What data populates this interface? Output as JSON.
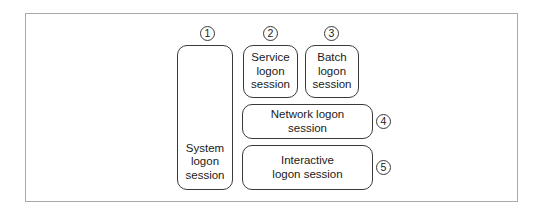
{
  "diagram": {
    "frame_color": "#a9a9a9",
    "stroke_color": "#3a3a3a",
    "sessions": [
      {
        "id": 1,
        "number": "1",
        "label": "System\nlogon\nsession"
      },
      {
        "id": 2,
        "number": "2",
        "label": "Service\nlogon\nsession"
      },
      {
        "id": 3,
        "number": "3",
        "label": "Batch\nlogon\nsession"
      },
      {
        "id": 4,
        "number": "4",
        "label": "Network logon\nsession"
      },
      {
        "id": 5,
        "number": "5",
        "label": "Interactive\nlogon session"
      }
    ]
  }
}
